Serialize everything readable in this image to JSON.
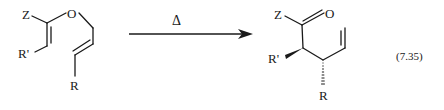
{
  "reaction": {
    "type": "Claisen rearrangement",
    "equation_number": "(7.35)",
    "condition_symbol": "Δ",
    "reactant": {
      "labels": {
        "z": "Z",
        "o": "O",
        "r_prime": "R'",
        "r": "R"
      }
    },
    "product": {
      "labels": {
        "z": "Z",
        "o": "O",
        "r_prime": "R'",
        "r": "R"
      }
    }
  },
  "colors": {
    "ink": "#1a1a1a",
    "background": "#ffffff"
  }
}
